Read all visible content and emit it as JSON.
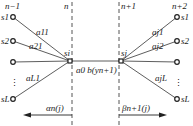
{
  "diagram": {
    "left_layer": {
      "label": "n−1",
      "nodes": [
        "s1",
        "s2",
        "",
        "sL"
      ],
      "dots": "⋮"
    },
    "right_layer": {
      "label": "n+2",
      "nodes": [
        "s1",
        "s2",
        "",
        "sL"
      ],
      "dots": "⋮"
    },
    "boundary_left": {
      "label": "n"
    },
    "boundary_right": {
      "label": "n+1"
    },
    "center_left_node": "si",
    "center_right_node": "sj",
    "left_edges": [
      "a11",
      "a21",
      "aL1"
    ],
    "right_edges": [
      "aj1",
      "aj2",
      "ajL"
    ],
    "center_edge": "a0 b(yn+1)",
    "alpha": "αn(j)",
    "beta": "βn+1(j)",
    "colors": {
      "line": "#333333",
      "dash": "#555555"
    }
  }
}
